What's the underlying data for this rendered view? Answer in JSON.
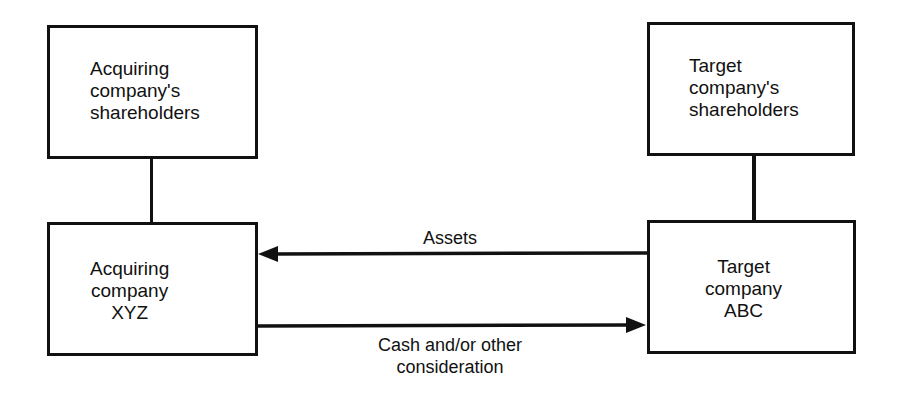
{
  "diagram": {
    "nodes": [
      {
        "id": "acq_sh",
        "lines": [
          "Acquiring",
          "company's",
          "shareholders"
        ]
      },
      {
        "id": "tgt_sh",
        "lines": [
          "Target",
          "company's",
          "shareholders"
        ]
      },
      {
        "id": "acq",
        "lines": [
          "Acquiring",
          "company",
          "XYZ"
        ]
      },
      {
        "id": "tgt",
        "lines": [
          "Target",
          "company",
          "ABC"
        ]
      }
    ],
    "edges": [
      {
        "from": "acq_sh",
        "to": "acq",
        "type": "line"
      },
      {
        "from": "tgt_sh",
        "to": "tgt",
        "type": "line"
      },
      {
        "from": "tgt",
        "to": "acq",
        "type": "arrow",
        "label": "Assets"
      },
      {
        "from": "acq",
        "to": "tgt",
        "type": "arrow",
        "label_lines": [
          "Cash and/or other",
          "consideration"
        ]
      }
    ]
  }
}
